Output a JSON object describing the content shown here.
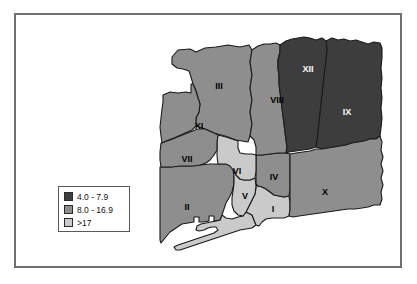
{
  "figure": {
    "background_color": "#ffffff",
    "frame_color": "#6f6f6f"
  },
  "palette": {
    "dark": "#3d3d3d",
    "medium": "#8e8e8e",
    "light": "#cacaca",
    "outline": "#1a1a1a",
    "water": "#ffffff"
  },
  "legend": {
    "title": "",
    "items": [
      {
        "label": "4.0 - 7.9",
        "swatch_color": "#3d3d3d",
        "class_key": "dark"
      },
      {
        "label": "8.0 - 16.9",
        "swatch_color": "#8e8e8e",
        "class_key": "medium"
      },
      {
        "label": ">17",
        "swatch_color": "#cacaca",
        "class_key": "light"
      }
    ]
  },
  "chart_data": {
    "type": "map",
    "xlabel": "",
    "ylabel": "",
    "legend_position": "lower-left",
    "classes": [
      {
        "key": "dark",
        "range_label": "4.0 - 7.9",
        "min": 4.0,
        "max": 7.9,
        "color": "#3d3d3d"
      },
      {
        "key": "medium",
        "range_label": "8.0 - 16.9",
        "min": 8.0,
        "max": 16.9,
        "color": "#8e8e8e"
      },
      {
        "key": "light",
        "range_label": ">17",
        "min": 17,
        "max": null,
        "color": "#cacaca"
      }
    ],
    "regions": [
      {
        "id": "I",
        "label": "I",
        "class_key": "light",
        "range_label": ">17",
        "label_x": 273,
        "label_y": 210
      },
      {
        "id": "II",
        "label": "II",
        "class_key": "medium",
        "range_label": "8.0 - 16.9",
        "label_x": 187,
        "label_y": 208
      },
      {
        "id": "III",
        "label": "III",
        "class_key": "medium",
        "range_label": "8.0 - 16.9",
        "label_x": 219,
        "label_y": 87
      },
      {
        "id": "IV",
        "label": "IV",
        "class_key": "medium",
        "range_label": "8.0 - 16.9",
        "label_x": 274,
        "label_y": 178
      },
      {
        "id": "V",
        "label": "V",
        "class_key": "light",
        "range_label": ">17",
        "label_x": 245,
        "label_y": 197
      },
      {
        "id": "VI",
        "label": "VI",
        "class_key": "light",
        "range_label": ">17",
        "label_x": 237,
        "label_y": 172
      },
      {
        "id": "VII",
        "label": "VII",
        "class_key": "medium",
        "range_label": "8.0 - 16.9",
        "label_x": 187,
        "label_y": 160
      },
      {
        "id": "VIII",
        "label": "VIII",
        "class_key": "medium",
        "range_label": "8.0 - 16.9",
        "label_x": 277,
        "label_y": 101
      },
      {
        "id": "IX",
        "label": "IX",
        "class_key": "dark",
        "range_label": "4.0 - 7.9",
        "label_x": 347,
        "label_y": 113
      },
      {
        "id": "X",
        "label": "X",
        "class_key": "medium",
        "range_label": "8.0 - 16.9",
        "label_x": 325,
        "label_y": 193
      },
      {
        "id": "XI",
        "label": "XI",
        "class_key": "medium",
        "range_label": "8.0 - 16.9",
        "label_x": 199,
        "label_y": 127
      },
      {
        "id": "XII",
        "label": "XII",
        "class_key": "dark",
        "range_label": "4.0 - 7.9",
        "label_x": 308,
        "label_y": 70
      }
    ],
    "shapes": {
      "III": "M 172,57 L 178,50 L 190,49 L 196,52 L 205,48 L 216,47 L 228,45 L 240,47 L 249,45 L 252,50 L 250,62 L 252,75 L 250,88 L 252,100 L 250,112 L 252,124 L 250,136 L 248,142 L 236,140 L 225,136 L 214,133 L 205,129 L 196,126 L 196,118 L 199,112 L 200,104 L 198,98 L 196,91 L 193,84 L 191,77 L 189,71 L 183,69 L 177,68 L 172,64 Z",
      "XI": "M 163,95 L 170,92 L 178,93 L 186,92 L 191,93 L 191,84 L 193,84 L 196,91 L 198,98 L 200,104 L 199,112 L 196,118 L 196,126 L 192,130 L 183,134 L 174,138 L 166,141 L 162,143 L 161,136 L 160,127 L 161,118 L 162,109 L 163,102 Z",
      "VII": "M 161,143 L 170,140 L 180,136 L 190,132 L 198,129 L 205,129 L 214,133 L 218,135 L 217,142 L 217,150 L 214,155 L 210,160 L 206,163 L 200,165 L 194,166 L 188,166 L 180,166 L 172,167 L 165,167 L 161,167 L 160,160 L 160,152 Z",
      "II": "M 160,167 L 170,167 L 180,166 L 190,166 L 200,165 L 210,164 L 218,164 L 226,164 L 233,165 L 234,174 L 234,184 L 232,192 L 229,198 L 226,203 L 224,209 L 222,215 L 220,220 L 214,221 L 214,216 L 209,216 L 209,221 L 203,222 L 199,222 L 199,217 L 194,217 L 194,222 L 188,223 L 182,224 L 176,228 L 170,232 L 165,238 L 161,243 L 160,240 L 160,225 L 160,208 L 160,190 Z",
      "VI": "M 218,135 L 226,137 L 232,139 L 238,141 L 238,148 L 240,153 L 246,154 L 252,154 L 256,155 L 256,163 L 256,171 L 255,178 L 250,180 L 244,180 L 240,179 L 236,175 L 233,170 L 230,166 L 226,164 L 218,164 L 217,156 L 217,148 L 217,141 Z",
      "V": "M 233,170 L 236,175 L 240,179 L 244,180 L 250,180 L 255,178 L 256,186 L 255,194 L 252,200 L 249,206 L 246,212 L 243,216 L 238,215 L 234,211 L 232,205 L 232,198 L 233,191 L 234,184 L 234,176 Z",
      "IV": "M 256,155 L 262,155 L 270,154 L 278,153 L 286,153 L 290,154 L 290,162 L 290,171 L 290,180 L 290,189 L 289,196 L 284,197 L 279,196 L 274,195 L 270,192 L 266,189 L 262,187 L 258,186 L 256,184 L 256,175 L 256,166 Z",
      "I": "M 256,184 L 258,186 L 262,187 L 266,189 L 270,192 L 274,195 L 279,196 L 284,197 L 289,196 L 290,203 L 290,210 L 289,216 L 284,218 L 278,218 L 272,218 L 266,219 L 262,222 L 259,226 L 256,225 L 254,220 L 252,215 L 248,213 L 246,212 L 249,206 L 252,200 L 255,194 L 256,188 Z",
      "VIII": "M 252,50 L 258,46 L 264,44 L 270,44 L 276,43 L 280,45 L 280,52 L 278,60 L 278,68 L 279,76 L 279,84 L 280,92 L 281,100 L 282,108 L 283,116 L 284,124 L 285,132 L 286,140 L 287,147 L 286,153 L 278,153 L 270,154 L 262,155 L 256,155 L 256,147 L 254,140 L 250,136 L 252,124 L 250,112 L 252,100 L 250,88 L 252,75 L 250,62 Z",
      "XII": "M 280,45 L 286,41 L 292,39 L 298,38 L 304,37 L 310,38 L 316,40 L 322,38 L 326,41 L 327,49 L 326,58 L 325,67 L 324,76 L 323,85 L 322,94 L 321,103 L 320,112 L 319,121 L 318,130 L 317,139 L 316,147 L 310,149 L 303,150 L 296,151 L 289,152 L 286,153 L 287,147 L 286,140 L 285,132 L 284,124 L 283,116 L 282,108 L 281,100 L 280,92 L 279,84 L 279,76 L 278,68 L 278,60 L 280,52 Z",
      "IX": "M 326,41 L 332,38 L 338,40 L 344,39 L 350,41 L 356,40 L 362,42 L 368,44 L 374,42 L 380,43 L 382,48 L 382,58 L 381,68 L 382,78 L 381,88 L 382,98 L 381,108 L 382,118 L 381,128 L 380,136 L 376,139 L 370,139 L 364,141 L 358,142 L 352,143 L 346,145 L 340,146 L 334,147 L 328,148 L 322,149 L 316,147 L 317,139 L 318,130 L 319,121 L 320,112 L 321,103 L 322,94 L 323,85 L 324,76 L 325,67 L 326,58 L 327,49 Z",
      "X": "M 290,154 L 296,153 L 303,152 L 310,151 L 316,149 L 322,149 L 328,148 L 334,147 L 340,146 L 346,145 L 352,143 L 358,142 L 364,141 L 370,139 L 376,139 L 380,136 L 382,142 L 381,150 L 383,157 L 381,164 L 383,171 L 381,178 L 383,185 L 381,192 L 382,199 L 380,205 L 374,205 L 368,207 L 362,208 L 355,209 L 348,209 L 341,210 L 334,211 L 327,212 L 320,213 L 313,214 L 306,215 L 299,216 L 293,217 L 289,216 L 290,210 L 290,203 L 290,196 L 290,189 L 290,180 L 290,171 L 290,162 Z",
      "SPIT": "M 222,215 L 226,218 L 232,219 L 238,217 L 243,216 L 246,212 L 248,213 L 252,215 L 254,220 L 256,225 L 252,228 L 246,229 L 240,230 L 234,232 L 228,234 L 222,236 L 216,238 L 210,240 L 204,242 L 198,244 L 192,246 L 186,248 L 180,250 L 176,250 L 174,247 L 178,245 L 184,243 L 190,241 L 196,239 L 202,237 L 208,235 L 214,233 L 218,230 L 216,227 L 212,227 L 208,228 L 204,230 L 199,231 L 196,230 L 197,226 L 201,224 L 206,223 L 211,222 L 216,221 L 220,220 Z"
    }
  }
}
